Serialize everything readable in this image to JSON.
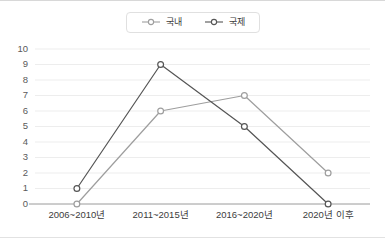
{
  "chart_data": {
    "type": "line",
    "title": "",
    "xlabel": "",
    "ylabel": "",
    "categories": [
      "2006~2010년",
      "2011~2015년",
      "2016~2020년",
      "2020년 이후"
    ],
    "series": [
      {
        "name": "국내",
        "values": [
          0,
          6,
          7,
          2
        ],
        "color": "#9e9e9e",
        "marker": "circle-open"
      },
      {
        "name": "국제",
        "values": [
          1,
          9,
          5,
          0
        ],
        "color": "#555555",
        "marker": "circle-open"
      }
    ],
    "ylim": [
      0,
      10
    ],
    "yticks": [
      0,
      1,
      2,
      3,
      4,
      5,
      6,
      7,
      8,
      9,
      10
    ],
    "ytick_labels": [
      "0",
      "1",
      "2",
      "3",
      "4",
      "5",
      "6",
      "7",
      "8",
      "9",
      "10"
    ],
    "grid": true,
    "grid_axis": "y",
    "legend_position": "top-center"
  },
  "legend": {
    "items": [
      {
        "label": "국내",
        "color": "#9e9e9e"
      },
      {
        "label": "국제",
        "color": "#555555"
      }
    ]
  }
}
